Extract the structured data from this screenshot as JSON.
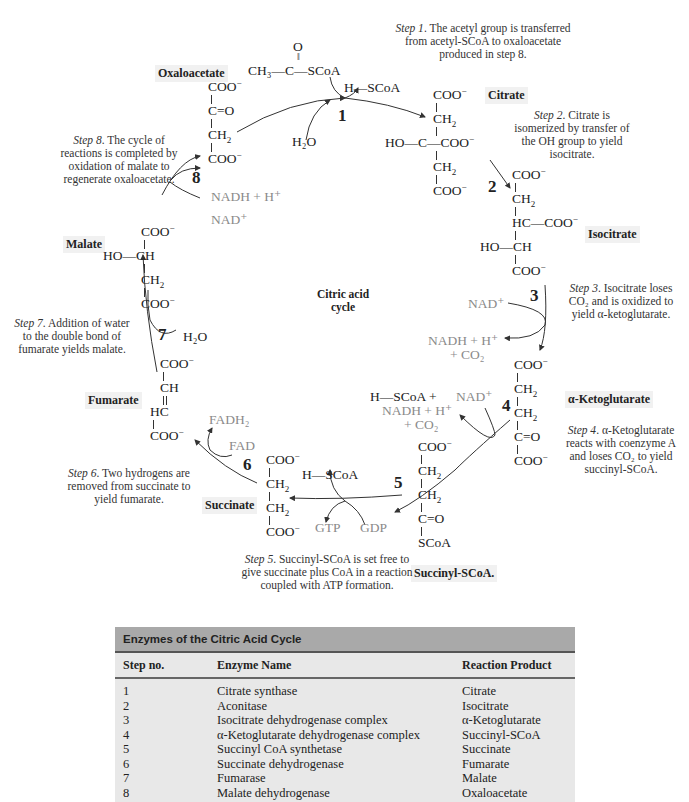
{
  "diagram": {
    "center_label": [
      "Citric acid",
      "cycle"
    ],
    "step_numbers": [
      "1",
      "2",
      "3",
      "4",
      "5",
      "6",
      "7",
      "8"
    ],
    "compound_labels": {
      "oxaloacetate": "Oxaloacetate",
      "citrate": "Citrate",
      "isocitrate": "Isocitrate",
      "ketoglutarate": "α-Ketoglutarate",
      "succinyl_scoa": "Succinyl-SCoA.",
      "succinate": "Succinate",
      "fumarate": "Fumarate",
      "malate": "Malate"
    },
    "step_descriptions": {
      "step1": {
        "lead": "Step 1",
        "text": ". The acetyl group is transferred from acetyl-SCoA to oxaloacetate produced in step 8."
      },
      "step2": {
        "lead": "Step 2",
        "text": ". Citrate is isomerized by transfer of the OH group to yield isocitrate."
      },
      "step3": {
        "lead": "Step 3",
        "text": ". Isocitrate loses CO₂ and is oxidized to yield α-ketoglutarate."
      },
      "step4": {
        "lead": "Step 4",
        "text": ". α-Ketoglutarate reacts with coenzyme A and loses CO₂ to yield succinyl-SCoA."
      },
      "step5": {
        "lead": "Step 5",
        "text": ". Succinyl-SCoA is set free to give succinate plus CoA in a reaction coupled with ATP formation."
      },
      "step6": {
        "lead": "Step 6",
        "text": ". Two hydrogens are removed from succinate to yield fumarate."
      },
      "step7": {
        "lead": "Step 7",
        "text": ". Addition of water to the double bond of fumarate yields malate."
      },
      "step8": {
        "lead": "Step 8",
        "text": ". The cycle of reactions is completed by oxidation of malate to regenerate oxaloacetate."
      }
    },
    "reagents": {
      "acetyl_scoa": "CH₃—C—SCoA",
      "acetyl_o": "O",
      "h_scoa_1": "H—SCoA",
      "h2o_1": "H₂O",
      "nad_3": "NAD⁺",
      "nadh_3": "NADH + H⁺",
      "co2_3": "+ CO₂",
      "h_scoa_4": "H—SCoA  +",
      "nad_4": "NAD⁺",
      "nadh_4": "NADH + H⁺",
      "co2_4": "+ CO₂",
      "h_scoa_5": "H—SCoA",
      "gtp": "GTP",
      "gdp": "GDP",
      "fadh2": "FADH₂",
      "fad": "FAD",
      "h2o_7": "H₂O",
      "nad_8": "NAD⁺",
      "nadh_8": "NADH + H⁺"
    },
    "colors": {
      "cofactor_gray": "#8a8a8a",
      "label_bg": "#f1f1f1",
      "table_header_bg": "#a9a9a9",
      "table_body_bg": "#e8e8e8"
    }
  },
  "table": {
    "title": "Enzymes of the Citric Acid Cycle",
    "columns": [
      "Step no.",
      "Enzyme Name",
      "Reaction Product"
    ],
    "rows": [
      [
        "1",
        "Citrate synthase",
        "Citrate"
      ],
      [
        "2",
        "Aconitase",
        "Isocitrate"
      ],
      [
        "3",
        "Isocitrate dehydrogenase complex",
        "α-Ketoglutarate"
      ],
      [
        "4",
        "α-Ketoglutarate dehydrogenase complex",
        "Succinyl-SCoA"
      ],
      [
        "5",
        "Succinyl CoA synthetase",
        "Succinate"
      ],
      [
        "6",
        "Succinate dehydrogenase",
        "Fumarate"
      ],
      [
        "7",
        "Fumarase",
        "Malate"
      ],
      [
        "8",
        "Malate dehydrogenase",
        "Oxaloacetate"
      ]
    ]
  }
}
